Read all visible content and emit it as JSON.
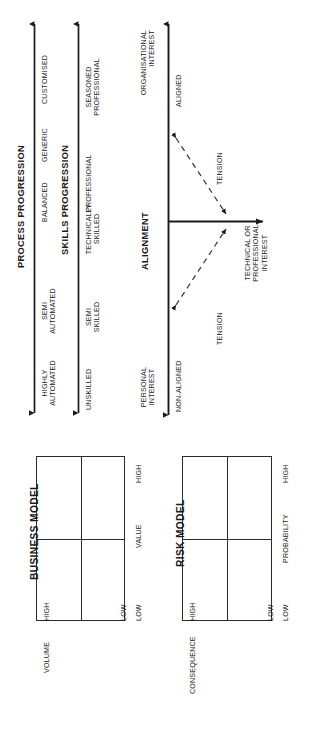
{
  "diagram": {
    "ink_color": "#1a1a1a"
  },
  "axes": [
    {
      "id": "process-progression",
      "title": "PROCESS PROGRESSION",
      "ticks": [
        "HIGHLY AUTOMATED",
        "SEMI AUTOMATED",
        "BALANCED",
        "GENERIC",
        "CUSTOMISED"
      ]
    },
    {
      "id": "skills-progression",
      "title": "SKILLS PROGRESSION",
      "ticks": [
        "UNSKILLED",
        "SEMI SKILLED",
        "TECHNICALLY SKILLED",
        "PROFESSIONAL",
        "SEASONED PROFESSIONAL"
      ]
    },
    {
      "id": "alignment",
      "title": "ALIGNMENT",
      "ticks": [
        "NON-ALIGNED",
        "ALIGNED"
      ],
      "vertical_axis_label": "ORGANISATIONAL INTEREST",
      "vertical_axis_low_label": "PERSONAL INTEREST",
      "horizontal_axis_label": "TECHNICAL OR PROFESSIONAL INTEREST",
      "tension_labels": [
        "TENSION",
        "TENSION"
      ]
    }
  ],
  "axis_tick_lines": {
    "process": [
      {
        "label": "HIGHLY AUTOMATED"
      },
      {
        "label": "SEMI AUTOMATED"
      },
      {
        "label": "BALANCED"
      },
      {
        "label": "GENERIC"
      },
      {
        "label": "CUSTOMISED"
      }
    ],
    "skills": [
      {
        "label": "UNSKILLED"
      },
      {
        "label": "SEMI SKILLED"
      },
      {
        "label": "TECHNICALLY SKILLED"
      },
      {
        "label": "PROFESSIONAL"
      },
      {
        "label": "SEASONED PROFESSIONAL"
      }
    ],
    "alignment": [
      {
        "label": "NON-ALIGNED"
      },
      {
        "label": "ALIGNED"
      }
    ]
  },
  "labels": {
    "process_tick_1": "HIGHLY",
    "process_tick_1b": "AUTOMATED",
    "process_tick_2": "SEMI",
    "process_tick_2b": "AUTOMATED",
    "process_tick_3": "BALANCED",
    "process_tick_4": "GENERIC",
    "process_tick_5": "CUSTOMISED",
    "skills_tick_1": "UNSKILLED",
    "skills_tick_2": "SEMI",
    "skills_tick_2b": "SKILLED",
    "skills_tick_3": "TECHNICALLY",
    "skills_tick_3b": "SKILLED",
    "skills_tick_4": "PROFESSIONAL",
    "skills_tick_5": "SEASONED",
    "skills_tick_5b": "PROFESSIONAL",
    "align_personal": "PERSONAL",
    "align_personal_b": "INTEREST",
    "align_org": "ORGANISATIONAL",
    "align_org_b": "INTEREST",
    "align_non": "NON-ALIGNED",
    "align_yes": "ALIGNED",
    "tension_upper": "TENSION",
    "tension_lower": "TENSION",
    "tech_prof_1": "TECHNICAL OR",
    "tech_prof_2": "PROFESSIONAL",
    "tech_prof_3": "INTEREST",
    "title_process": "PROCESS PROGRESSION",
    "title_skills": "SKILLS PROGRESSION",
    "title_alignment": "ALIGNMENT"
  },
  "models": [
    {
      "id": "business-model",
      "title": "BUSINESS MODEL",
      "x_axis_label": "VOLUME",
      "x_axis_low": "LOW",
      "x_axis_high": "HIGH",
      "y_axis_label": "VALUE",
      "y_axis_low": "LOW",
      "y_axis_high": "HIGH"
    },
    {
      "id": "risk-model",
      "title": "RISK MODEL",
      "x_axis_label": "CONSEQUENCE",
      "x_axis_low": "LOW",
      "x_axis_high": "HIGH",
      "y_axis_label": "PROBABILITY",
      "y_axis_low": "LOW",
      "y_axis_high": "HIGH"
    }
  ]
}
